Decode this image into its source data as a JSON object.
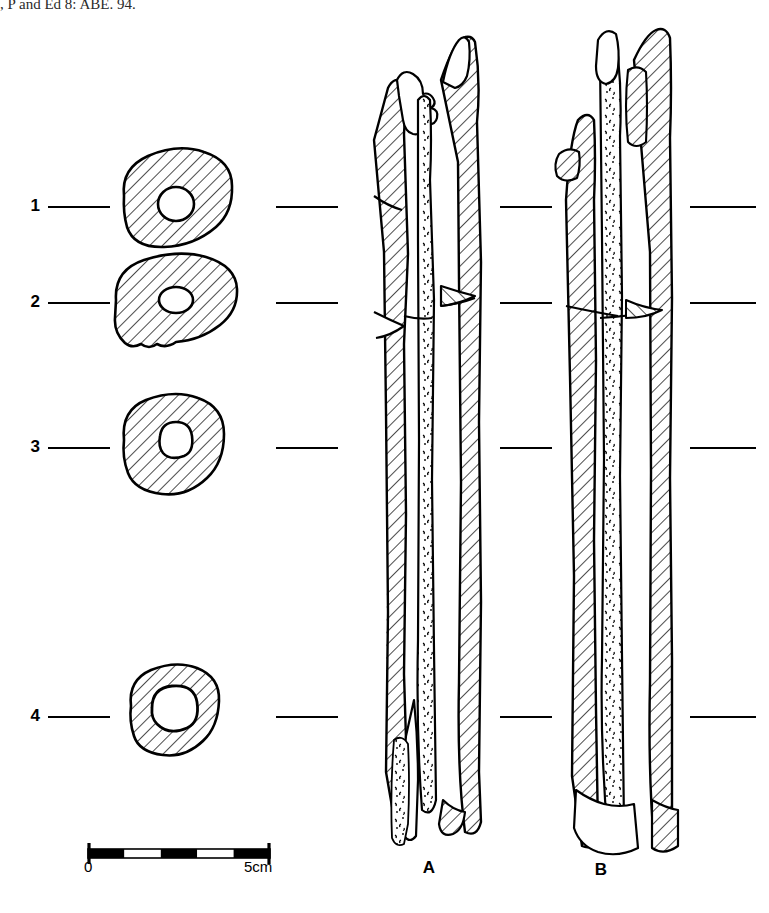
{
  "figure": {
    "domain_note": "archaeological long-bone illustration",
    "truncated_caption_top": ", P and Ed 8: ABE. 94.",
    "background_color": "#ffffff",
    "ink_color": "#000000"
  },
  "cross_sections": {
    "label_names": [
      "section-1",
      "section-2",
      "section-3",
      "section-4"
    ],
    "items": [
      {
        "label": "1",
        "label_x": 30,
        "label_y": 198,
        "leader": {
          "x1": 48,
          "y1": 207,
          "x2": 110,
          "y2": 207
        },
        "outline_cx": 176,
        "outline_cy": 207,
        "outline_rx": 58,
        "outline_ry": 46,
        "hole_cx": 176,
        "hole_cy": 204,
        "hole_rx": 18,
        "hole_ry": 17,
        "shape": "irregular-oval-tilted",
        "tick": {
          "x1": 276,
          "y1": 207,
          "x2": 338,
          "y2": 207
        }
      },
      {
        "label": "2",
        "label_x": 30,
        "label_y": 295,
        "leader": {
          "x1": 48,
          "y1": 303,
          "x2": 110,
          "y2": 303
        },
        "outline_cx": 176,
        "outline_cy": 303,
        "outline_rx": 62,
        "outline_ry": 44,
        "hole_cx": 176,
        "hole_cy": 300,
        "hole_rx": 17,
        "hole_ry": 13,
        "shape": "broad-flattened-oval",
        "tick": {
          "x1": 276,
          "y1": 303,
          "x2": 338,
          "y2": 303
        }
      },
      {
        "label": "3",
        "label_x": 30,
        "label_y": 440,
        "leader": {
          "x1": 48,
          "y1": 448,
          "x2": 110,
          "y2": 448
        },
        "outline_cx": 174,
        "outline_cy": 448,
        "outline_rx": 52,
        "outline_ry": 48,
        "hole_cx": 174,
        "hole_cy": 444,
        "hole_rx": 16,
        "hole_ry": 16,
        "shape": "rounded-oval",
        "tick": {
          "x1": 276,
          "y1": 448,
          "x2": 338,
          "y2": 448
        }
      },
      {
        "label": "4",
        "label_x": 30,
        "label_y": 709,
        "leader": {
          "x1": 48,
          "y1": 717,
          "x2": 110,
          "y2": 717
        },
        "outline_cx": 174,
        "outline_cy": 712,
        "outline_rx": 45,
        "outline_ry": 44,
        "hole_cx": 174,
        "hole_cy": 710,
        "hole_rx": 21,
        "hole_ry": 20,
        "shape": "small-ring",
        "tick": {
          "x1": 276,
          "y1": 717,
          "x2": 338,
          "y2": 717
        }
      }
    ]
  },
  "level_ticks": {
    "between_bones": [
      {
        "x1": 500,
        "y1": 207,
        "x2": 552,
        "y2": 207
      },
      {
        "x1": 500,
        "y1": 303,
        "x2": 552,
        "y2": 303
      },
      {
        "x1": 500,
        "y1": 448,
        "x2": 552,
        "y2": 448
      },
      {
        "x1": 500,
        "y1": 717,
        "x2": 552,
        "y2": 717
      }
    ],
    "right_of_bones": [
      {
        "x1": 690,
        "y1": 207,
        "x2": 756,
        "y2": 207
      },
      {
        "x1": 690,
        "y1": 303,
        "x2": 756,
        "y2": 303
      },
      {
        "x1": 690,
        "y1": 448,
        "x2": 756,
        "y2": 448
      },
      {
        "x1": 690,
        "y1": 717,
        "x2": 756,
        "y2": 717
      }
    ]
  },
  "bone_views": [
    {
      "label": "A",
      "name": "bone-view-a",
      "label_x": 428,
      "label_y": 868,
      "top_y": 30,
      "bottom_y": 845,
      "left_x": 372,
      "right_x": 500,
      "description": "longitudinal split long bone, hatched cortical walls with stippled medullary infill"
    },
    {
      "label": "B",
      "name": "bone-view-b",
      "label_x": 600,
      "label_y": 870,
      "top_y": 28,
      "bottom_y": 850,
      "left_x": 560,
      "right_x": 690,
      "description": "second longitudinal view, hatched cortex both sides with stippled marrow cavity"
    }
  ],
  "scale_bar": {
    "name": "scale-bar",
    "x": 88,
    "y": 849,
    "width": 182,
    "height": 9,
    "segments": 5,
    "segment_colors": [
      "#000000",
      "#ffffff",
      "#000000",
      "#ffffff",
      "#000000"
    ],
    "start_label": "0",
    "end_label": "5cm",
    "start_label_x": 86,
    "end_label_x": 248,
    "label_y": 861,
    "unit": "cm",
    "total_value": 5
  }
}
